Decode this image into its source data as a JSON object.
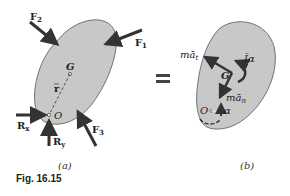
{
  "figure": {
    "caption": "Fig. 16.15",
    "panels": [
      {
        "id": "a",
        "label": "(a)",
        "body_fill": "#c8c8c8",
        "points": {
          "center_of_mass": "G",
          "pivot": "O"
        },
        "position_vector": "r",
        "forces": [
          {
            "name": "F",
            "sub": "1"
          },
          {
            "name": "F",
            "sub": "2"
          },
          {
            "name": "F",
            "sub": "3"
          },
          {
            "name": "R",
            "sub": "x"
          },
          {
            "name": "R",
            "sub": "y"
          }
        ]
      },
      {
        "id": "b",
        "label": "(b)",
        "body_fill": "#c8c8c8",
        "points": {
          "center_of_mass": "G",
          "pivot": "O"
        },
        "vectors": [
          {
            "name": "mā",
            "sub": "t"
          },
          {
            "name": "mā",
            "sub": "n"
          },
          {
            "name": "Īα",
            "sub": ""
          },
          {
            "name": "α",
            "sub": ""
          }
        ]
      }
    ],
    "equals_sign": "="
  }
}
